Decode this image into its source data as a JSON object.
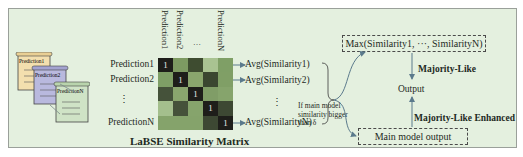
{
  "figure": {
    "predictions": {
      "scrolls": [
        {
          "label": "Prediction1",
          "color": "#f3dfae"
        },
        {
          "label": "Prediction2",
          "color": "#b9b9de"
        },
        {
          "label": "PredictionN",
          "color": "#cfe3c6"
        }
      ]
    },
    "matrix": {
      "title": "LaBSE Similarity Matrix",
      "column_headers": [
        "Prediction1",
        "Prediction2",
        "…",
        "PredictionN"
      ],
      "row_labels": [
        "Prediction1",
        "Prediction2",
        "⋮",
        "PredictionN"
      ],
      "diagonal_value": "1",
      "cells": [
        [
          "#1e1e1a",
          "#7d9a62",
          "#3e4c30",
          "#a9c392",
          "#7f9f66"
        ],
        [
          "#7f9f66",
          "#1e1e1a",
          "#8aa66d",
          "#3a4630",
          "#809f66"
        ],
        [
          "#45523a",
          "#8aa66e",
          "#1e1e1a",
          "#809d67",
          "#86a46c"
        ],
        [
          "#a4bf8d",
          "#45523a",
          "#86a46c",
          "#1e1e1a",
          "#3d4833"
        ],
        [
          "#85a36b",
          "#85a36b",
          "#85a36b",
          "#3d4833",
          "#1e1e1a"
        ]
      ]
    },
    "averages": {
      "items": [
        "Avg(Similarity1)",
        "Avg(Similarity2)",
        "⋮",
        "Avg(SimilarityN)"
      ]
    },
    "condition": {
      "text": "If main model similarity bigger than δ"
    },
    "max_box": {
      "label": "Max(Similarity1, ···, SimilarityN)"
    },
    "main_model_box": {
      "label": "Main model output"
    },
    "output": {
      "label": "Output"
    },
    "majority_like": {
      "label": "Majority-Like"
    },
    "majority_like_enhanced": {
      "label": "Majority-Like Enhanced"
    },
    "colors": {
      "background": "#e4f0df",
      "arrow": "#5b7a8c",
      "line": "#3a3a3a"
    }
  }
}
